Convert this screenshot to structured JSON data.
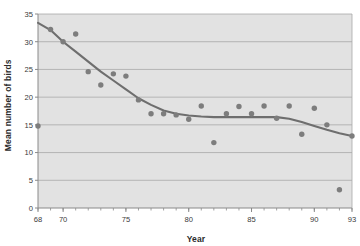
{
  "chart_data": {
    "type": "scatter",
    "title": "",
    "xlabel": "Year",
    "ylabel": "Mean number of birds",
    "xlim": [
      68,
      93
    ],
    "ylim": [
      0,
      35
    ],
    "grid": true,
    "legend": false,
    "xticks": [
      68,
      70,
      75,
      80,
      85,
      90,
      93
    ],
    "xtick_labels": [
      "68",
      "70",
      "75",
      "80",
      "85",
      "90",
      "93"
    ],
    "xminor_ticks": [
      68,
      69,
      70,
      71,
      72,
      73,
      74,
      75,
      76,
      77,
      78,
      79,
      80,
      81,
      82,
      83,
      84,
      85,
      86,
      87,
      88,
      89,
      90,
      91,
      92,
      93
    ],
    "yticks": [
      0,
      5,
      10,
      15,
      20,
      25,
      30,
      35
    ],
    "ytick_labels": [
      "0",
      "5",
      "10",
      "15",
      "20",
      "25",
      "30",
      "35"
    ],
    "x": [
      68,
      69,
      70,
      71,
      72,
      73,
      74,
      75,
      76,
      77,
      78,
      79,
      80,
      81,
      82,
      83,
      84,
      85,
      86,
      87,
      88,
      89,
      90,
      91,
      92,
      93
    ],
    "values": [
      14.8,
      32.2,
      30.0,
      31.4,
      24.6,
      22.2,
      24.2,
      23.8,
      19.5,
      17.0,
      17.0,
      16.8,
      16.0,
      18.4,
      11.8,
      17.0,
      18.3,
      17.0,
      18.4,
      16.2,
      18.4,
      13.3,
      18.0,
      15.0,
      3.3,
      13.0
    ],
    "series": [
      {
        "name": "Mean number of birds",
        "type": "scatter",
        "marker": "circle",
        "color": "#7d7d7d",
        "values": [
          14.8,
          32.2,
          30.0,
          31.4,
          24.6,
          22.2,
          24.2,
          23.8,
          19.5,
          17.0,
          17.0,
          16.8,
          16.0,
          18.4,
          11.8,
          17.0,
          18.3,
          17.0,
          18.4,
          16.2,
          18.4,
          13.3,
          18.0,
          15.0,
          3.3,
          13.0
        ]
      },
      {
        "name": "Smoothed trend",
        "type": "line",
        "color": "#6e6e6e",
        "x": [
          68,
          69,
          70,
          71,
          72,
          73,
          74,
          75,
          76,
          77,
          78,
          79,
          80,
          81,
          82,
          83,
          84,
          85,
          86,
          87,
          88,
          89,
          90,
          91,
          92,
          93
        ],
        "values": [
          33.4,
          32.1,
          30.0,
          28.2,
          26.4,
          24.6,
          23.0,
          21.4,
          19.8,
          18.6,
          17.6,
          17.0,
          16.7,
          16.5,
          16.4,
          16.4,
          16.4,
          16.4,
          16.4,
          16.4,
          16.1,
          15.5,
          14.8,
          14.1,
          13.5,
          13.0
        ]
      }
    ],
    "colors": {
      "plot_background": "#e2e2e2",
      "grid_line": "#a8a8a8",
      "axis_line": "#8a8a8a",
      "marker": "#7d7d7d",
      "trend_line": "#6e6e6e",
      "text": "#2b2b2b",
      "page_background": "#ffffff"
    }
  },
  "axes": {
    "x_title": "Year",
    "y_title": "Mean number of birds"
  }
}
